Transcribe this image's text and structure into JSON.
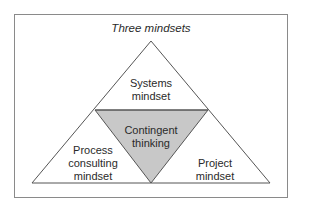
{
  "title": "Three mindsets",
  "nodes": {
    "top": {
      "line1": "Systems",
      "line2": "mindset"
    },
    "center": {
      "line1": "Contingent",
      "line2": "thinking"
    },
    "left": {
      "line1": "Process",
      "line2": "consulting",
      "line3": "mindset"
    },
    "right": {
      "line1": "Project",
      "line2": "mindset"
    }
  },
  "colors": {
    "border": "#8a8a8a",
    "line": "#555555",
    "center_fill": "#c8c8c8",
    "background": "#ffffff"
  }
}
